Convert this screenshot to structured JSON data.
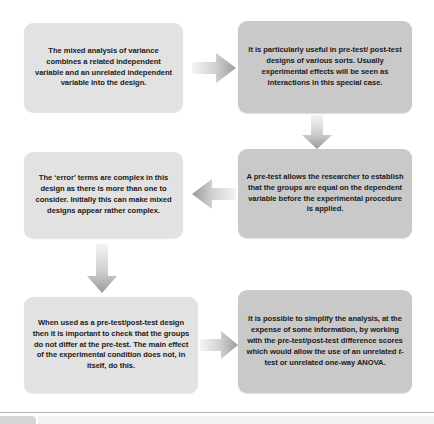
{
  "diagram": {
    "type": "flowchart",
    "colors": {
      "box_light": "#e2e2e2",
      "box_dark": "#c9c9c9",
      "text": "#1b1b1b",
      "arrow_light": "#f0f0f0",
      "arrow_dark": "#9a9a9a",
      "divider": "#b6b6b6",
      "page_background": "#ffffff"
    },
    "boxes": [
      {
        "id": "mixed-anova",
        "column": "left",
        "row": 1,
        "shade": "light",
        "text": "The mixed analysis of variance combines a related independent variable and an unrelated independent variable into the design."
      },
      {
        "id": "pretest-posttest",
        "column": "right",
        "row": 1,
        "shade": "dark",
        "text": "It is particularly useful in pre-test/ post-test designs of various sorts. Usually experimental effects will be seen as interactions in this special case."
      },
      {
        "id": "error-terms",
        "column": "left",
        "row": 2,
        "shade": "light",
        "text": "The ‘error’ terms are complex in this design as there is more than one to consider. Initially this can make mixed designs appear rather complex."
      },
      {
        "id": "pretest-groups",
        "column": "right",
        "row": 2,
        "shade": "dark",
        "text": "A pre-test allows the researcher to establish that the groups are equal on the dependent variable before the experimental procedure is applied."
      },
      {
        "id": "check-groups",
        "column": "left",
        "row": 3,
        "shade": "light",
        "text": "When used as a pre-test/post-test design then it is important to check that the groups do not differ at the pre-test. The main effect of the experimental condition does not, in itself, do this."
      },
      {
        "id": "simplify-analysis",
        "column": "right",
        "row": 3,
        "shade": "dark",
        "text_before_italic": "It is possible to simplify the analysis, at the expense of some information, by working with the pre-test/post-test difference scores which would allow the use of an unrelated ",
        "italic_term": "t",
        "text_after_italic": "-test or unrelated one-way ANOVA."
      }
    ],
    "arrows": [
      {
        "id": "top-right",
        "direction": "right",
        "from": "mixed-anova",
        "to": "pretest-posttest"
      },
      {
        "id": "right-down",
        "direction": "down",
        "from": "pretest-posttest",
        "to": "pretest-groups"
      },
      {
        "id": "mid-left",
        "direction": "left",
        "from": "pretest-groups",
        "to": "error-terms"
      },
      {
        "id": "left-down",
        "direction": "down",
        "from": "error-terms",
        "to": "check-groups"
      },
      {
        "id": "bottom-right",
        "direction": "right",
        "from": "check-groups",
        "to": "simplify-analysis"
      }
    ]
  }
}
